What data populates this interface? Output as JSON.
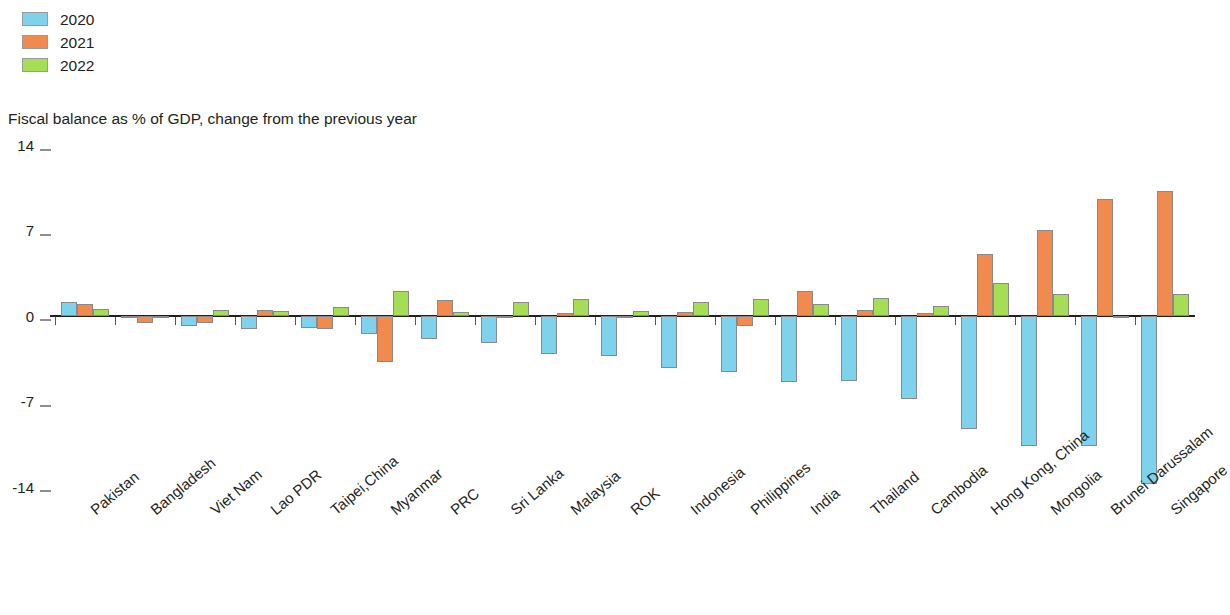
{
  "legend": {
    "items": [
      {
        "label": "2020",
        "color": "#7ed2ec"
      },
      {
        "label": "2021",
        "color": "#f08a4e"
      },
      {
        "label": "2022",
        "color": "#a5dd54"
      }
    ]
  },
  "subtitle": "Fiscal balance as % of GDP, change from the previous year",
  "chart_data": {
    "type": "bar",
    "title": "",
    "subtitle": "Fiscal balance as % of GDP, change from the previous year",
    "xlabel": "",
    "ylabel": "",
    "ylim": [
      -15.5,
      14
    ],
    "yticks": [
      14,
      7,
      0,
      -7,
      -14
    ],
    "ytick_labels": [
      "14",
      "7",
      "0",
      "-7",
      "-14"
    ],
    "grid": false,
    "legend_position": "top-left",
    "categories": [
      "Pakistan",
      "Bangladesh",
      "Viet Nam",
      "Lao PDR",
      "Taipei,China",
      "Myanmar",
      "PRC",
      "Sri Lanka",
      "Malaysia",
      "ROK",
      "Indonesia",
      "Philippines",
      "India",
      "Thailand",
      "Cambodia",
      "Hong Kong, China",
      "Mongolia",
      "Brunei Darussalam",
      "Singapore"
    ],
    "series": [
      {
        "name": "2020",
        "color": "#7ed2ec",
        "values": [
          1.1,
          -0.1,
          -0.8,
          -1.1,
          -1.0,
          -1.5,
          -1.9,
          -2.2,
          -3.1,
          -3.3,
          -4.3,
          -4.6,
          -5.4,
          -5.3,
          -6.8,
          -9.3,
          -10.7,
          -10.7,
          -13.8
        ]
      },
      {
        "name": "2021",
        "color": "#f08a4e",
        "values": [
          1.0,
          -0.6,
          -0.6,
          0.5,
          -1.1,
          -3.8,
          1.3,
          -0.1,
          0.2,
          -0.05,
          0.3,
          -0.8,
          2.0,
          0.5,
          0.2,
          5.1,
          7.0,
          9.6,
          10.2
        ]
      },
      {
        "name": "2022",
        "color": "#a5dd54",
        "values": [
          0.6,
          -0.05,
          0.5,
          0.4,
          0.7,
          2.0,
          0.3,
          1.1,
          1.4,
          0.4,
          1.1,
          1.4,
          1.0,
          1.5,
          0.8,
          2.7,
          1.8,
          -0.2,
          1.8
        ]
      }
    ]
  }
}
